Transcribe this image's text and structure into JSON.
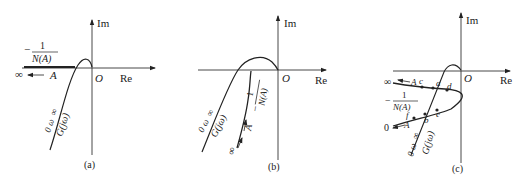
{
  "figure": {
    "panels": [
      {
        "id": "a",
        "caption": "(a)",
        "axis_labels": {
          "im": "Im",
          "re": "Re",
          "origin": "O"
        },
        "neg_inv_N": {
          "minus": "−",
          "num": "1",
          "den": "N(A)"
        },
        "A_arrow": {
          "infinity": "∞",
          "A": "A"
        },
        "G_label": {
          "omega_range_zero": "0",
          "omega": "ω",
          "omega_inf": "∞",
          "G": "G(jω)"
        }
      },
      {
        "id": "b",
        "caption": "(b)",
        "axis_labels": {
          "im": "Im",
          "re": "Re",
          "origin": "O"
        },
        "neg_inv_N": {
          "minus": "−",
          "num": "1",
          "den": "N(A)"
        },
        "A_arrow": {
          "infinity": "∞",
          "A": "A"
        },
        "G_label": {
          "omega_range_zero": "0",
          "omega": "ω",
          "omega_inf": "∞",
          "G": "G(jω)"
        }
      },
      {
        "id": "c",
        "caption": "(c)",
        "axis_labels": {
          "im": "Im",
          "re": "Re",
          "origin": "O"
        },
        "neg_inv_N": {
          "minus": "−",
          "num": "1",
          "den": "N(A)"
        },
        "A_arrow_top": {
          "infinity": "∞",
          "A": "A"
        },
        "A_arrow_bottom": {
          "zero": "0",
          "A": "A"
        },
        "points": [
          "a",
          "b",
          "c",
          "d",
          "e",
          "f"
        ],
        "G_label": {
          "omega_range_zero": "0",
          "omega": "ω",
          "omega_inf": "∞",
          "G": "G(jω)"
        }
      }
    ]
  }
}
